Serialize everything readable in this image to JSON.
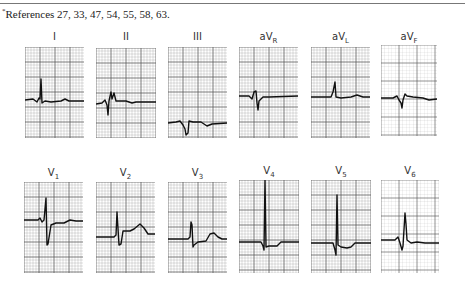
{
  "footnote": {
    "marker": "*",
    "text": "References 27, 33, 47, 54, 55, 58, 63."
  },
  "figure": {
    "type": "12-lead ECG tracings",
    "grid_color": "#555555",
    "trace_color": "#111111",
    "rows": [
      {
        "name": "limb-leads",
        "leads": [
          {
            "id": "I",
            "label": "I",
            "sub": ""
          },
          {
            "id": "II",
            "label": "II",
            "sub": ""
          },
          {
            "id": "III",
            "label": "III",
            "sub": ""
          },
          {
            "id": "aVR",
            "label": "aV",
            "sub": "R"
          },
          {
            "id": "aVL",
            "label": "aV",
            "sub": "L"
          },
          {
            "id": "aVF",
            "label": "aV",
            "sub": "F"
          }
        ]
      },
      {
        "name": "precordial-leads",
        "leads": [
          {
            "id": "V1",
            "label": "V",
            "sub": "1"
          },
          {
            "id": "V2",
            "label": "V",
            "sub": "2"
          },
          {
            "id": "V3",
            "label": "V",
            "sub": "3"
          },
          {
            "id": "V4",
            "label": "V",
            "sub": "4"
          },
          {
            "id": "V5",
            "label": "V",
            "sub": "5"
          },
          {
            "id": "V6",
            "label": "V",
            "sub": "6"
          }
        ]
      }
    ]
  }
}
